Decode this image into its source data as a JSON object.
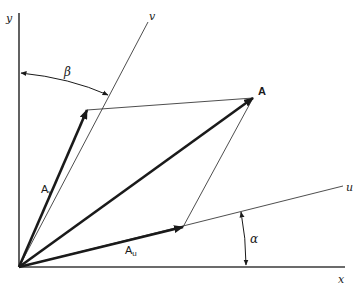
{
  "diagram": {
    "type": "vector-decomposition",
    "axes": {
      "x": {
        "label": "x",
        "from": [
          19,
          267
        ],
        "to": [
          345,
          267
        ]
      },
      "y": {
        "label": "y",
        "from": [
          19,
          267
        ],
        "to": [
          19,
          13
        ]
      },
      "u": {
        "label": "u",
        "from": [
          19,
          267
        ],
        "to": [
          343,
          186
        ]
      },
      "v": {
        "label": "v",
        "from": [
          19,
          267
        ],
        "to": [
          148,
          22
        ]
      }
    },
    "vectors": {
      "A": {
        "label": "A",
        "tip": [
          253,
          98
        ]
      },
      "Au": {
        "label": "A",
        "subscript": "u",
        "tip": [
          183,
          227
        ]
      },
      "Av": {
        "label": "A",
        "subscript": "v",
        "tip": [
          87,
          110
        ]
      }
    },
    "angles": {
      "alpha": {
        "label": "α",
        "between": [
          "x",
          "u"
        ]
      },
      "beta": {
        "label": "β",
        "between": [
          "y",
          "v"
        ]
      }
    },
    "colors": {
      "ink": "#1a1a1a",
      "thin": "#3a3a3a",
      "background": "#ffffff"
    }
  }
}
